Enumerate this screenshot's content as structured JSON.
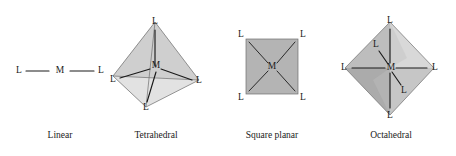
{
  "figure": {
    "background_color": "#ffffff",
    "ink_color": "#1a1a1a",
    "metal_symbol": "M",
    "ligand_symbol": "L"
  },
  "palette": {
    "square_fill": "#b4b4b4",
    "square_edge": "#6e6e6e",
    "tetra_face_left": "#c9c9c9",
    "tetra_face_right": "#d6d6d6",
    "tetra_face_front": "#bdbdbd",
    "tetra_face_bottom": "#dcdcdc",
    "octa_face_upper_left": "#b9b9b9",
    "octa_face_upper_right": "#d2d2d2",
    "octa_face_lower_left": "#a9a9a9",
    "octa_face_lower_right": "#c4c4c4",
    "octa_face_inner": "#9e9e9e"
  },
  "geometries": [
    {
      "id": "linear",
      "caption": "Linear",
      "coordination_number": 2,
      "center_label": "M",
      "ligand_labels": [
        "L",
        "L"
      ]
    },
    {
      "id": "tetrahedral",
      "caption": "Tetrahedral",
      "coordination_number": 4,
      "center_label": "M",
      "ligand_labels": [
        "L",
        "L",
        "L",
        "L"
      ]
    },
    {
      "id": "square-planar",
      "caption": "Square planar",
      "coordination_number": 4,
      "center_label": "M",
      "ligand_labels": [
        "L",
        "L",
        "L",
        "L"
      ]
    },
    {
      "id": "octahedral",
      "caption": "Octahedral",
      "coordination_number": 6,
      "center_label": "M",
      "ligand_labels": [
        "L",
        "L",
        "L",
        "L",
        "L",
        "L"
      ]
    }
  ],
  "linear": {
    "caption": "Linear",
    "left_ligand": "L",
    "center": "M",
    "right_ligand": "L"
  },
  "tetrahedral": {
    "caption": "Tetrahedral",
    "center": "M",
    "apex_ligand": "L",
    "left_ligand": "L",
    "right_ligand": "L",
    "front_ligand": "L"
  },
  "square_planar": {
    "caption": "Square planar",
    "center": "M",
    "top_left_ligand": "L",
    "top_right_ligand": "L",
    "bottom_left_ligand": "L",
    "bottom_right_ligand": "L"
  },
  "octahedral": {
    "caption": "Octahedral",
    "center": "M",
    "top_ligand": "L",
    "bottom_ligand": "L",
    "left_ligand": "L",
    "right_ligand": "L",
    "back_ligand": "L",
    "front_ligand": "L"
  }
}
